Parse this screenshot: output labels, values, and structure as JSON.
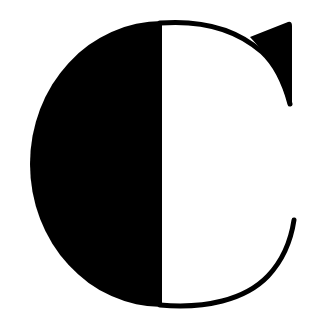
{
  "logo": {
    "name": "C monogram logo",
    "letter": "C",
    "colors": {
      "background": "#ffffff",
      "ink": "#000000"
    },
    "style": "half-filled serif C with triangular top serif"
  }
}
